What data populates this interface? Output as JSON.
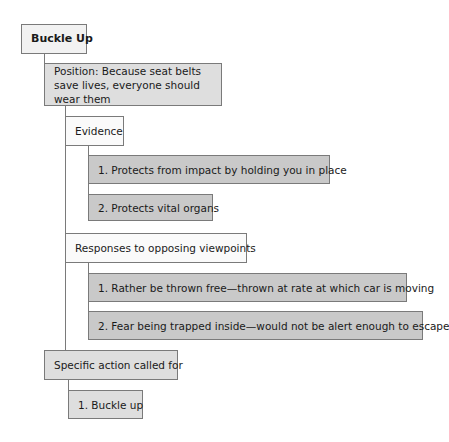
{
  "diagram": {
    "title": "Buckle Up",
    "position": "Position: Because seat belts save lives, everyone should wear them",
    "sections": [
      {
        "heading": "Evidence",
        "items": [
          "1. Protects from impact by holding you in place",
          "2. Protects vital organs"
        ]
      },
      {
        "heading": "Responses to opposing viewpoints",
        "items": [
          "1. Rather be thrown free—thrown at rate at which car is moving",
          "2. Fear being trapped inside—would not be alert enough to escape"
        ]
      }
    ],
    "action": {
      "heading": "Specific action called for",
      "items": [
        "1. Buckle up"
      ]
    }
  },
  "colors": {
    "title_fill": "#f2f2f2",
    "position_fill": "#dedede",
    "section_fill": "#fafafa",
    "item_fill": "#c9c9c9",
    "border": "#7a7a7a"
  }
}
